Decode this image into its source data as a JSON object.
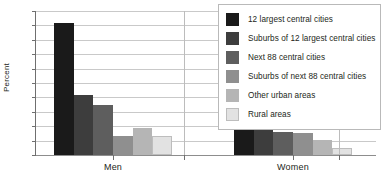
{
  "chart_data": {
    "type": "bar",
    "title": "",
    "xlabel": "",
    "ylabel": "Percent",
    "ylim": [
      0,
      10
    ],
    "ytick_values": [
      0,
      1,
      2,
      3,
      4,
      5,
      6,
      7,
      8,
      9,
      10
    ],
    "ytick_labels": [
      "0",
      "1",
      "2",
      "3",
      "4",
      "5",
      "6",
      "7",
      "8",
      "9",
      "10"
    ],
    "grid": true,
    "legend_position": "upper right",
    "categories": [
      "Men",
      "Women"
    ],
    "series": [
      {
        "name": "12 largest central cities",
        "color": "#1a1a1a",
        "outlined": false,
        "values": [
          9.2,
          2.5
        ]
      },
      {
        "name": "Suburbs of 12 largest central cities",
        "color": "#3d3d3d",
        "outlined": false,
        "values": [
          4.2,
          1.85
        ]
      },
      {
        "name": "Next 88 central cities",
        "color": "#5e5e5e",
        "outlined": false,
        "values": [
          3.5,
          1.6
        ]
      },
      {
        "name": "Suburbs of next 88 central cities",
        "color": "#8f8f8f",
        "outlined": false,
        "values": [
          1.3,
          1.5
        ]
      },
      {
        "name": "Other urban areas",
        "color": "#b5b5b5",
        "outlined": false,
        "values": [
          1.9,
          1.05
        ]
      },
      {
        "name": "Rural areas",
        "color": "#e2e2e2",
        "outlined": true,
        "values": [
          1.3,
          0.5
        ]
      }
    ]
  },
  "legend": {
    "items": [
      "12 largest central cities",
      "Suburbs of 12 largest central cities",
      "Next 88 central cities",
      "Suburbs of next 88 central cities",
      "Other urban areas",
      "Rural areas"
    ]
  },
  "axis": {
    "y_title": "Percent"
  }
}
